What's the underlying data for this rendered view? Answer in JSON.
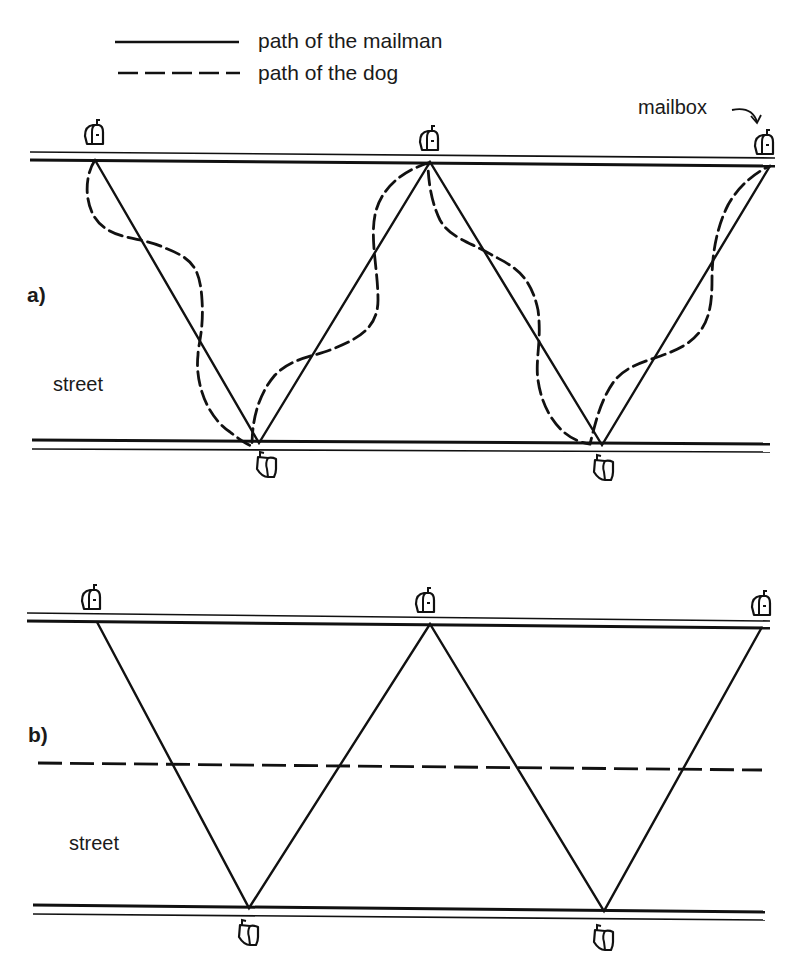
{
  "legend": {
    "items": [
      {
        "style": "solid",
        "label": "path of the mailman"
      },
      {
        "style": "dashed",
        "label": "path of the dog"
      }
    ]
  },
  "annotations": {
    "mailbox_label": "mailbox"
  },
  "panels": [
    {
      "id": "a",
      "label": "a)",
      "street_label": "street",
      "mailboxes": {
        "top": 3,
        "bottom": 2
      },
      "mailman_path": "straight zigzag between mailboxes on alternating sides",
      "dog_path": "wavy dashed curve oscillating around the mailman's zigzag"
    },
    {
      "id": "b",
      "label": "b)",
      "street_label": "street",
      "mailboxes": {
        "top": 3,
        "bottom": 2
      },
      "mailman_path": "straight zigzag between mailboxes on alternating sides",
      "dog_path": "straight dashed line down the middle of the street"
    }
  ],
  "colors": {
    "ink": "#111111",
    "background": "#ffffff"
  }
}
